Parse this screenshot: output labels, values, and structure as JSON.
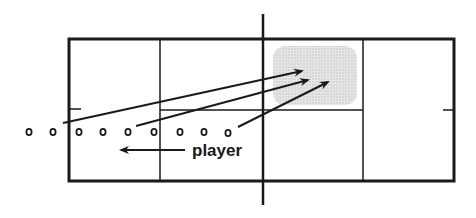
{
  "diagram": {
    "label": "player",
    "colors": {
      "line": "#1a1a1a",
      "shade": "#d9d9d9",
      "background": "#ffffff"
    },
    "court": {
      "x": 69,
      "y": 39,
      "width": 385,
      "height": 142
    },
    "players": [
      {
        "x": 29,
        "y": 132
      },
      {
        "x": 53,
        "y": 132
      },
      {
        "x": 79,
        "y": 132
      },
      {
        "x": 103,
        "y": 132
      },
      {
        "x": 128,
        "y": 132
      },
      {
        "x": 154,
        "y": 132
      },
      {
        "x": 180,
        "y": 132
      },
      {
        "x": 204,
        "y": 132
      },
      {
        "x": 228,
        "y": 132
      }
    ],
    "arrows": [
      {
        "from": [
          63,
          123
        ],
        "to": [
          302,
          71
        ]
      },
      {
        "from": [
          136,
          126
        ],
        "to": [
          308,
          80
        ]
      },
      {
        "from": [
          238,
          127
        ],
        "to": [
          328,
          82
        ]
      }
    ],
    "movement_arrow": {
      "from": [
        185,
        150
      ],
      "to": [
        120,
        150
      ]
    },
    "target_zone": {
      "x": 273,
      "y": 46,
      "width": 84,
      "height": 59
    }
  }
}
